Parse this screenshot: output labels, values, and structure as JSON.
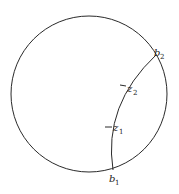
{
  "diagram": {
    "stroke_color": "#2a2a2a",
    "circle": {
      "cx": 89,
      "cy": 94,
      "r": 78
    },
    "geodesic": {
      "start": "b1",
      "end": "b2"
    },
    "labels": {
      "b1": {
        "base": "b",
        "sub": "1"
      },
      "b2": {
        "base": "b",
        "sub": "2"
      },
      "z1": {
        "base": "z",
        "sub": "1"
      },
      "z2": {
        "base": "z",
        "sub": "2"
      }
    }
  }
}
